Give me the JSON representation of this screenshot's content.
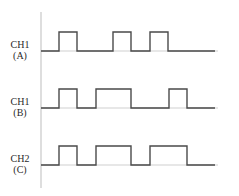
{
  "diagram": {
    "type": "digital-timing-waveforms",
    "axis": {
      "x": 41,
      "y_top": 12,
      "y_bottom": 188
    },
    "x_end": 215,
    "channels": [
      {
        "id": "A",
        "label_line1": "CH1",
        "label_line2": "(A)",
        "low_y": 51,
        "high_y": 32,
        "pulses": [
          [
            59,
            77
          ],
          [
            113,
            131
          ],
          [
            150,
            168
          ]
        ]
      },
      {
        "id": "B",
        "label_line1": "CH1",
        "label_line2": "(B)",
        "low_y": 108,
        "high_y": 89,
        "pulses": [
          [
            59,
            77
          ],
          [
            96,
            131
          ],
          [
            169,
            187
          ]
        ]
      },
      {
        "id": "C",
        "label_line1": "CH2",
        "label_line2": "(C)",
        "low_y": 165,
        "high_y": 146,
        "pulses": [
          [
            59,
            77
          ],
          [
            96,
            131
          ],
          [
            150,
            187
          ]
        ]
      }
    ],
    "colors": {
      "wave": "#4a4a4a",
      "axis": "#bdbdbd",
      "text": "#2a2a2a"
    }
  }
}
